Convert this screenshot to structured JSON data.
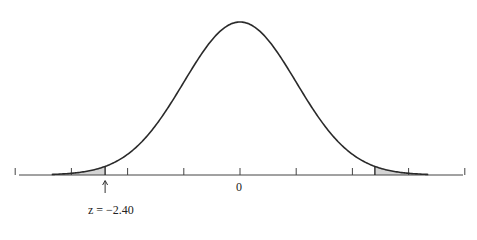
{
  "chart_data": {
    "type": "area",
    "title": "",
    "xlabel": "",
    "ylabel": "",
    "x_range": [
      -4,
      4
    ],
    "ticks": [
      -4,
      -3,
      -2,
      -1,
      0,
      1,
      2,
      3,
      4
    ],
    "tick_labels": [
      {
        "value": 0,
        "label": "0"
      }
    ],
    "curve": {
      "distribution": "normal",
      "mean": 0,
      "sd": 1,
      "x_start": -3.35,
      "x_end": 3.35
    },
    "shaded_regions": [
      {
        "from": -3.35,
        "to": -2.4,
        "color": "#d4d4d4"
      },
      {
        "from": 2.4,
        "to": 3.35,
        "color": "#d4d4d4"
      }
    ],
    "annotations": [
      {
        "x": -2.4,
        "type": "arrow-up",
        "label": "z = −2.40"
      }
    ],
    "grid": false,
    "legend": null
  },
  "labels": {
    "zero": "0",
    "z_value": "z = −2.40",
    "arrow": "↑"
  },
  "colors": {
    "curve": "#2a2a2a",
    "axis": "#444444",
    "shade": "#d4d4d4"
  }
}
